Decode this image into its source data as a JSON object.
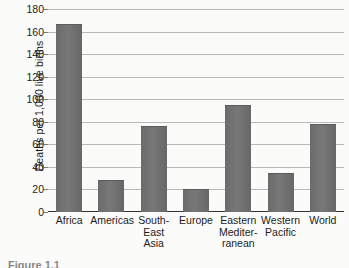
{
  "chart_data": {
    "type": "bar",
    "title": "",
    "xlabel": "",
    "ylabel": "Deaths per 1,000 live births",
    "ylim": [
      0,
      180
    ],
    "ytick_step": 20,
    "yticks": [
      0,
      20,
      40,
      60,
      80,
      100,
      120,
      140,
      160,
      180
    ],
    "ytick_labels": [
      "0",
      "20",
      "40",
      "60",
      "80",
      "100",
      "120",
      "140",
      "160",
      "180"
    ],
    "grid": true,
    "legend": false,
    "categories": [
      "Africa",
      "Americas",
      "South-East Asia",
      "Europe",
      "Eastern Mediterranean",
      "Western Pacific",
      "World"
    ],
    "category_label_lines": [
      [
        "Africa"
      ],
      [
        "Americas"
      ],
      [
        "South-",
        "East",
        "Asia"
      ],
      [
        "Europe"
      ],
      [
        "Eastern",
        "Mediter-",
        "ranean"
      ],
      [
        "Western",
        "Pacific"
      ],
      [
        "World"
      ]
    ],
    "values": [
      167,
      28,
      76,
      20,
      95,
      35,
      78
    ],
    "bar_color": "#6f6f6f"
  },
  "caption": {
    "text": "Figure 1.1"
  }
}
